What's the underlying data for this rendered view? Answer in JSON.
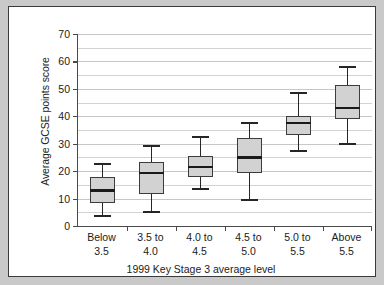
{
  "chart_data": {
    "type": "box",
    "title": "",
    "xlabel": "1999 Key Stage 3 average level",
    "ylabel": "Average GCSE points score",
    "ylim": [
      0,
      70
    ],
    "ytick_labels": [
      "0",
      "10",
      "20",
      "30",
      "40",
      "50",
      "60",
      "70"
    ],
    "ytick_values": [
      0,
      10,
      20,
      30,
      40,
      50,
      60,
      70
    ],
    "minor_gridline_values": [
      5,
      15,
      25,
      35,
      45,
      55,
      65
    ],
    "grid": true,
    "legend": "none",
    "categories": [
      "Below\n3.5",
      "3.5 to\n4.0",
      "4.0 to\n4.5",
      "4.5 to\n5.0",
      "5.0 to\n5.5",
      "Above\n5.5"
    ],
    "category_lines": [
      [
        "Below",
        "3.5"
      ],
      [
        "3.5 to",
        "4.0"
      ],
      [
        "4.0 to",
        "4.5"
      ],
      [
        "4.5 to",
        "5.0"
      ],
      [
        "5.0 to",
        "5.5"
      ],
      [
        "Above",
        "5.5"
      ]
    ],
    "boxes": [
      {
        "category": "Below 3.5",
        "min": 3.5,
        "q1": 8.5,
        "median": 13.0,
        "q3": 18.0,
        "max": 22.5
      },
      {
        "category": "3.5 to 4.0",
        "min": 5.0,
        "q1": 11.5,
        "median": 19.5,
        "q3": 23.5,
        "max": 29.0
      },
      {
        "category": "4.0 to 4.5",
        "min": 13.5,
        "q1": 18.0,
        "median": 21.5,
        "q3": 25.5,
        "max": 32.5
      },
      {
        "category": "4.5 to 5.0",
        "min": 9.5,
        "q1": 19.5,
        "median": 25.0,
        "q3": 32.0,
        "max": 37.5
      },
      {
        "category": "5.0 to 5.5",
        "min": 27.5,
        "q1": 33.0,
        "median": 37.5,
        "q3": 40.0,
        "max": 48.5
      },
      {
        "category": "Above 5.5",
        "min": 30.0,
        "q1": 39.0,
        "median": 43.0,
        "q3": 51.5,
        "max": 58.0
      }
    ],
    "colors": {
      "box_fill": "#d2d2d2",
      "box_edge": "#3c3c3c",
      "median": "#1a1a1a",
      "whisker": "#262626",
      "gridline": "#d2d2d2",
      "axis": "#4a4a4a",
      "panel_background": "#ffffff",
      "figure_background": "#c9c9c9",
      "panel_border": "#3a3a3a",
      "text": "#1b1b1b"
    }
  }
}
